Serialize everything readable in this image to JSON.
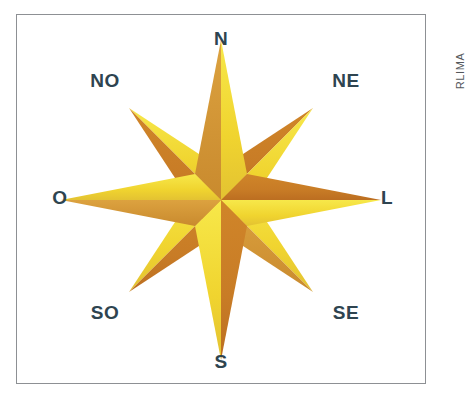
{
  "figure": {
    "kind": "compass-rose",
    "title_text": "",
    "credit": "RLIMA",
    "background_color": "#ffffff",
    "frame_color": "#8d9094",
    "label_color": "#2e4450"
  },
  "palette": {
    "yellow_light": "#f7e23f",
    "yellow": "#f0d42f",
    "yellow_deep": "#e8c63a",
    "orange": "#cf8129",
    "orange_dark": "#c06f22",
    "tan": "#d79a3c"
  },
  "compass": {
    "points": [
      {
        "id": "n",
        "label": "N",
        "bearing_deg": 0,
        "kind": "cardinal",
        "label_x": 205,
        "label_y": 24
      },
      {
        "id": "ne",
        "label": "NE",
        "bearing_deg": 45,
        "kind": "ordinal",
        "label_x": 330,
        "label_y": 66
      },
      {
        "id": "l",
        "label": "L",
        "bearing_deg": 90,
        "kind": "cardinal",
        "label_x": 371,
        "label_y": 183
      },
      {
        "id": "se",
        "label": "SE",
        "bearing_deg": 135,
        "kind": "ordinal",
        "label_x": 330,
        "label_y": 298
      },
      {
        "id": "s",
        "label": "S",
        "bearing_deg": 180,
        "kind": "cardinal",
        "label_x": 205,
        "label_y": 347
      },
      {
        "id": "so",
        "label": "SO",
        "bearing_deg": 225,
        "kind": "ordinal",
        "label_x": 89,
        "label_y": 298
      },
      {
        "id": "o",
        "label": "O",
        "bearing_deg": 270,
        "kind": "cardinal",
        "label_x": 44,
        "label_y": 183
      },
      {
        "id": "no",
        "label": "NO",
        "bearing_deg": 315,
        "kind": "ordinal",
        "label_x": 89,
        "label_y": 66
      }
    ],
    "center_x": 205,
    "center_y": 186,
    "cardinal_length": 160,
    "ordinal_length": 130,
    "point_half_width": 26
  }
}
